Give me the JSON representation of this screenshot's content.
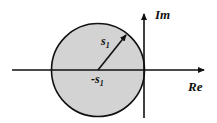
{
  "diagram": {
    "type": "complex-plane",
    "colors": {
      "background": "#ffffff",
      "stroke": "#111111",
      "circle_fill": "#d3d3d3"
    },
    "axes": {
      "real_label": "Re",
      "imag_label": "Im"
    },
    "circle": {
      "center_label_main": "-s",
      "center_label_sub": "1",
      "radius_label_main": "s",
      "radius_label_sub": "1"
    }
  }
}
